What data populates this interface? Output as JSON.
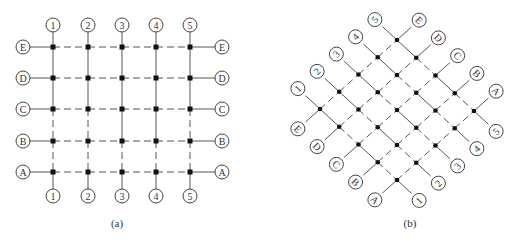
{
  "diagrams": [
    {
      "id": "a",
      "caption": "(a)",
      "caption_pos": [
        117,
        225
      ],
      "type": "orthogonal-grid",
      "columns": [
        {
          "label": "1",
          "x": 53
        },
        {
          "label": "2",
          "x": 88
        },
        {
          "label": "3",
          "x": 122
        },
        {
          "label": "4",
          "x": 156
        },
        {
          "label": "5",
          "x": 190
        }
      ],
      "rows": [
        {
          "label": "E",
          "y": 47
        },
        {
          "label": "D",
          "y": 78
        },
        {
          "label": "C",
          "y": 109
        },
        {
          "label": "B",
          "y": 141
        },
        {
          "label": "A",
          "y": 172
        }
      ],
      "col_label_top_y": 25,
      "col_label_bottom_y": 196,
      "row_label_left_x": 23,
      "row_label_right_x": 222,
      "vertical_segments_solid": [
        [
          true,
          true,
          true,
          true,
          true
        ],
        [
          true,
          true,
          true,
          true,
          true
        ],
        [
          false,
          false,
          true,
          true,
          false
        ],
        [
          false,
          false,
          false,
          false,
          false
        ]
      ],
      "horizontal_segments_style": "dashed"
    },
    {
      "id": "b",
      "caption": "(b)",
      "caption_pos": [
        410,
        225
      ],
      "type": "rotated-grid",
      "origin_node_1E": [
        320,
        109
      ],
      "col_step": [
        19.25,
        -17.25
      ],
      "row_step": [
        19.25,
        17.75
      ],
      "columns": [
        "1",
        "2",
        "3",
        "4",
        "5"
      ],
      "rows": [
        "E",
        "D",
        "C",
        "B",
        "A"
      ]
    }
  ],
  "colors": {
    "line": "#555555",
    "node": "#111111",
    "circle_stroke": "#444444",
    "text": "#333333"
  }
}
